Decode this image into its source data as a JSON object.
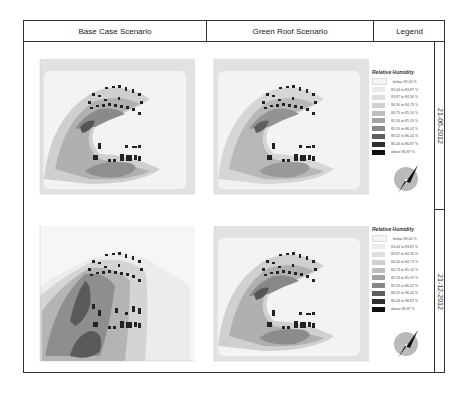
{
  "header": {
    "col1": "Base Case Scenario",
    "col2": "Green Roof Scenario",
    "col3": "Legend"
  },
  "rows": [
    {
      "date": "21-06-2012"
    },
    {
      "date": "21-12-2012"
    }
  ],
  "legend": {
    "title": "Relative Humidity",
    "items": [
      {
        "label": "below 83.44 %",
        "color": "#f4f4f4"
      },
      {
        "label": "83.44 to 83.87 %",
        "color": "#ebebeb"
      },
      {
        "label": "83.87 to 84.30 %",
        "color": "#dedede"
      },
      {
        "label": "84.30 to 84.73 %",
        "color": "#d0d0d0"
      },
      {
        "label": "84.73 to 85.16 %",
        "color": "#bdbdbd"
      },
      {
        "label": "85.16 to 85.59 %",
        "color": "#a3a3a3"
      },
      {
        "label": "85.59 to 86.02 %",
        "color": "#878787"
      },
      {
        "label": "86.02 to 86.44 %",
        "color": "#5e5e5e"
      },
      {
        "label": "86.44 to 86.87 %",
        "color": "#2f2f2f"
      },
      {
        "label": "above 86.87 %",
        "color": "#101010"
      }
    ]
  },
  "maps": [
    {
      "id": "base-summer",
      "scenario": "Base Case Scenario",
      "date": "21-06-2012"
    },
    {
      "id": "green-summer",
      "scenario": "Green Roof Scenario",
      "date": "21-06-2012"
    },
    {
      "id": "base-winter",
      "scenario": "Base Case Scenario",
      "date": "21-12-2012"
    },
    {
      "id": "green-winter",
      "scenario": "Green Roof Scenario",
      "date": "21-12-2012"
    }
  ],
  "compass": {
    "icon": "north-arrow-icon"
  }
}
